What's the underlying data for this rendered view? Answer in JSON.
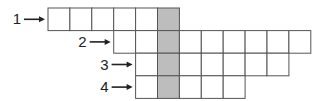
{
  "diagram": {
    "title": "",
    "rows": [
      {
        "label": "1",
        "start_col": 0,
        "cells": 6,
        "shaded_index": 5
      },
      {
        "label": "2",
        "start_col": 3,
        "cells": 9,
        "shaded_index": 2
      },
      {
        "label": "3",
        "start_col": 4,
        "cells": 7,
        "shaded_index": 1
      },
      {
        "label": "4",
        "start_col": 4,
        "cells": 5,
        "shaded_index": 1
      }
    ],
    "shaded_color": "#bdbdbd",
    "line_color": "#555555"
  }
}
